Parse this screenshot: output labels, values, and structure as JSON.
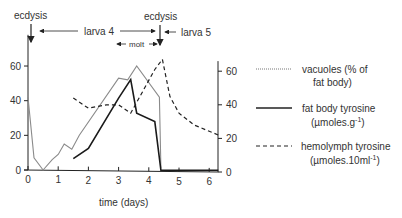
{
  "chart_data": {
    "type": "line",
    "title": "",
    "xlabel": "time (days)",
    "ylabel_left": "",
    "ylabel_right": "",
    "xlim": [
      0,
      6.3
    ],
    "ylim_left": [
      0,
      70
    ],
    "ylim_right": [
      0,
      70
    ],
    "x_ticks": [
      "0",
      "1",
      "2",
      "3",
      "4",
      "5",
      "6"
    ],
    "y_ticks_left": [
      "0",
      "20",
      "40",
      "60"
    ],
    "y_ticks_right": [
      "0",
      "20",
      "40",
      "60"
    ],
    "grid": false,
    "legend_position": "right",
    "annotations": [
      {
        "text": "ecdysis",
        "x": 0,
        "note": "arrow pointing down at day 0"
      },
      {
        "text": "ecdysis",
        "x": 4.45,
        "note": "arrow pointing down at ~day 4.45"
      },
      {
        "text": "larva 4",
        "span": [
          0,
          4.45
        ]
      },
      {
        "text": "larva 5",
        "start": 4.45
      },
      {
        "text": "molt",
        "span": [
          3.4,
          4.45
        ]
      }
    ],
    "series": [
      {
        "name": "vacuoles (% of fat body)",
        "axis": "left",
        "style": "thin",
        "x": [
          0,
          0.2,
          0.5,
          0.8,
          1.0,
          1.2,
          1.45,
          1.7,
          3.0,
          3.3,
          3.6,
          4.35,
          4.4
        ],
        "values": [
          42,
          7,
          0,
          6,
          9,
          15,
          12,
          20,
          53,
          52,
          60,
          42,
          1
        ]
      },
      {
        "name": "fat body tyrosine (µmoles.g-1)",
        "axis": "right",
        "style": "solid",
        "x": [
          1.5,
          2.0,
          3.0,
          3.4,
          3.6,
          4.2,
          4.4,
          5.0,
          6.3
        ],
        "values": [
          8,
          14,
          44,
          55,
          35,
          30,
          1,
          1,
          1
        ]
      },
      {
        "name": "hemolymph tyrosine (µmoles.10ml-1)",
        "axis": "right",
        "style": "dashed",
        "x": [
          1.5,
          2.0,
          2.6,
          3.0,
          3.4,
          4.2,
          4.45,
          4.7,
          5.0,
          5.5,
          6.3
        ],
        "values": [
          44,
          38,
          40,
          40,
          35,
          61,
          67,
          45,
          35,
          28,
          22
        ]
      }
    ]
  },
  "labels": {
    "ecdysis_left": "ecdysis",
    "ecdysis_right": "ecdysis",
    "larva4": "larva 4",
    "larva5": "larva 5",
    "molt": "molt",
    "xlabel": "time (days)"
  },
  "legend": [
    {
      "line1": "vacuoles (% of",
      "line2": "fat body)",
      "style": "thin"
    },
    {
      "line1": "fat body tyrosine",
      "line2": "(µmoles.g",
      "sup": "-1",
      "close": ")",
      "style": "solid"
    },
    {
      "line1": "hemolymph tyrosine",
      "line2": "(µmoles.10ml",
      "sup": "-1",
      "close": ")",
      "style": "dashed"
    }
  ]
}
